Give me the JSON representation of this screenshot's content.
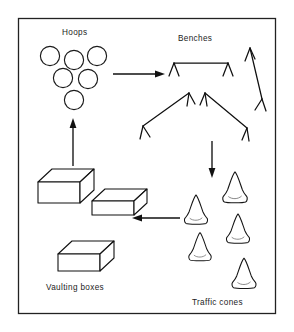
{
  "figure": {
    "background_color": "#ffffff",
    "ink_color": "#141414",
    "frame": {
      "x": 18,
      "y": 18,
      "width": 258,
      "height": 296
    },
    "labels": [
      {
        "id": "hoops",
        "text": "Hoops",
        "x": 62,
        "y": 35
      },
      {
        "id": "benches",
        "text": "Benches",
        "x": 178,
        "y": 40
      },
      {
        "id": "vaulting-boxes",
        "text": "Vaulting boxes",
        "x": 46,
        "y": 288
      },
      {
        "id": "traffic-cones",
        "text": "Traffic cones",
        "x": 192,
        "y": 303
      }
    ],
    "groups": [
      {
        "id": "hoops-group",
        "label": "Hoops",
        "kind": "circles",
        "count": 6,
        "radius": 9.5,
        "items": [
          {
            "cx": 50,
            "cy": 56
          },
          {
            "cx": 74,
            "cy": 60
          },
          {
            "cx": 97,
            "cy": 56
          },
          {
            "cx": 63,
            "cy": 77
          },
          {
            "cx": 88,
            "cy": 79
          },
          {
            "cx": 74,
            "cy": 99
          }
        ]
      },
      {
        "id": "benches-group",
        "label": "Benches",
        "kind": "benches",
        "count": 4,
        "items": [
          {
            "id": "bench-top",
            "x1": 174,
            "y1": 63,
            "x2": 228,
            "y2": 63,
            "leg": 9
          },
          {
            "id": "bench-right",
            "x1": 251,
            "y1": 48,
            "x2": 261,
            "y2": 98,
            "leg": 9
          },
          {
            "id": "bench-left",
            "x1": 143,
            "y1": 125,
            "x2": 189,
            "y2": 93,
            "leg": 9
          },
          {
            "id": "bench-mid",
            "x1": 206,
            "y1": 93,
            "x2": 246,
            "y2": 127,
            "leg": 9
          }
        ]
      },
      {
        "id": "boxes-group",
        "label": "Vaulting boxes",
        "kind": "boxes",
        "count": 3,
        "items": [
          {
            "id": "box-1",
            "x": 38,
            "y": 172,
            "w": 42,
            "h": 20,
            "dx": 14,
            "dy": -13
          },
          {
            "id": "box-2",
            "x": 92,
            "y": 192,
            "w": 42,
            "h": 14,
            "dx": 13,
            "dy": -12
          },
          {
            "id": "box-3",
            "x": 58,
            "y": 244,
            "w": 42,
            "h": 17,
            "dx": 14,
            "dy": -13
          }
        ]
      },
      {
        "id": "cones-group",
        "label": "Traffic cones",
        "kind": "cones",
        "count": 6,
        "items": [
          {
            "id": "cone-1",
            "cx": 196,
            "cy": 214,
            "s": 1.0
          },
          {
            "id": "cone-2",
            "cx": 235,
            "cy": 192,
            "s": 1.06
          },
          {
            "id": "cone-3",
            "cx": 238,
            "cy": 233,
            "s": 1.0
          },
          {
            "id": "cone-4",
            "cx": 200,
            "cy": 250,
            "s": 0.97
          },
          {
            "id": "cone-5",
            "cx": 244,
            "cy": 278,
            "s": 1.04
          },
          {
            "id": "cone-6",
            "cx": 197,
            "cy": 214,
            "s": 0.0
          }
        ]
      }
    ],
    "arrows": [
      {
        "id": "arrow-hoops-to-benches",
        "direction": "right",
        "x1": 113,
        "y1": 74,
        "x2": 163,
        "y2": 74
      },
      {
        "id": "arrow-benches-to-cones",
        "direction": "down",
        "x1": 212,
        "y1": 140,
        "x2": 212,
        "y2": 175
      },
      {
        "id": "arrow-cones-to-boxes",
        "direction": "left",
        "x1": 180,
        "y1": 218,
        "x2": 134,
        "y2": 218
      },
      {
        "id": "arrow-boxes-to-hoops",
        "direction": "up",
        "x1": 73,
        "y1": 165,
        "x2": 73,
        "y2": 120
      }
    ]
  }
}
